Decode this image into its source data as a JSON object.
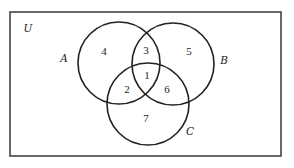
{
  "diagram": {
    "type": "venn",
    "universe": {
      "label": "U",
      "rect": {
        "x1": 10,
        "y1": 12,
        "x2": 281,
        "y2": 156
      },
      "label_pos": {
        "x": 28,
        "y": 32
      }
    },
    "sets": [
      {
        "id": "A",
        "label": "A",
        "cx": 119,
        "cy": 63,
        "r": 41,
        "label_pos": {
          "x": 64,
          "y": 62
        }
      },
      {
        "id": "B",
        "label": "B",
        "cx": 173,
        "cy": 64,
        "r": 41,
        "label_pos": {
          "x": 224,
          "y": 64
        }
      },
      {
        "id": "C",
        "label": "C",
        "cx": 148,
        "cy": 104,
        "r": 41,
        "label_pos": {
          "x": 190,
          "y": 135
        }
      }
    ],
    "regions": [
      {
        "id": "A-only",
        "label": "4",
        "x": 104,
        "y": 55
      },
      {
        "id": "A-and-B-only",
        "label": "3",
        "x": 146,
        "y": 54
      },
      {
        "id": "B-only",
        "label": "5",
        "x": 189,
        "y": 55
      },
      {
        "id": "A-and-B-and-C",
        "label": "1",
        "x": 147,
        "y": 79
      },
      {
        "id": "A-and-C-only",
        "label": "2",
        "x": 127,
        "y": 93
      },
      {
        "id": "B-and-C-only",
        "label": "6",
        "x": 167,
        "y": 93
      },
      {
        "id": "C-only",
        "label": "7",
        "x": 146,
        "y": 122
      }
    ],
    "colors": {
      "stroke": "#222222",
      "frame": "#444444",
      "background": "#ffffff"
    }
  }
}
